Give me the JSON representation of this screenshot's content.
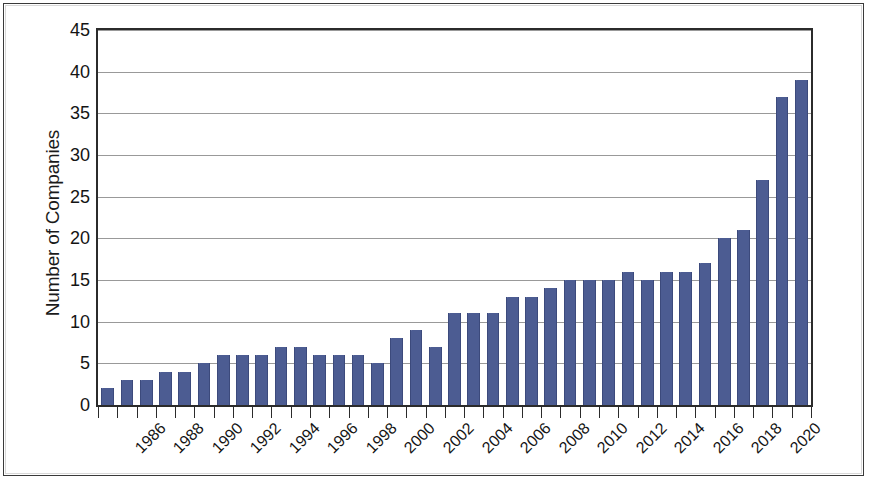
{
  "chart_data": {
    "type": "bar",
    "title": "",
    "xlabel": "",
    "ylabel": "Number of Companies",
    "ylim": [
      0,
      45
    ],
    "ytick_step": 5,
    "yticks": [
      0,
      5,
      10,
      15,
      20,
      25,
      30,
      35,
      40,
      45
    ],
    "grid": true,
    "legend": "none",
    "bar_color": "#4c5c92",
    "categories": [
      "1986",
      "1987",
      "1988",
      "1989",
      "1990",
      "1991",
      "1992",
      "1993",
      "1994",
      "1995",
      "1996",
      "1997",
      "1998",
      "1999",
      "2000",
      "2001",
      "2002",
      "2003",
      "2004",
      "2005",
      "2006",
      "2007",
      "2008",
      "2009",
      "2010",
      "2011",
      "2012",
      "2013",
      "2014",
      "2015",
      "2016",
      "2017",
      "2018",
      "2019",
      "2020",
      "2021"
    ],
    "values": [
      2,
      3,
      3,
      4,
      4,
      5,
      6,
      6,
      6,
      7,
      7,
      6,
      6,
      6,
      5,
      8,
      9,
      7,
      11,
      11,
      11,
      13,
      13,
      14,
      15,
      15,
      15,
      16,
      15,
      16,
      16,
      17,
      20,
      21,
      27,
      37
    ],
    "visible_xtick_labels": [
      "1986",
      "1988",
      "1990",
      "1992",
      "1994",
      "1996",
      "1998",
      "2000",
      "2002",
      "2004",
      "2006",
      "2008",
      "2010",
      "2012",
      "2014",
      "2016",
      "2018",
      "2020"
    ],
    "xtick_label_rotation_degrees": -45,
    "last_bar_value": 39,
    "max_value": 39,
    "min_value": 2
  }
}
